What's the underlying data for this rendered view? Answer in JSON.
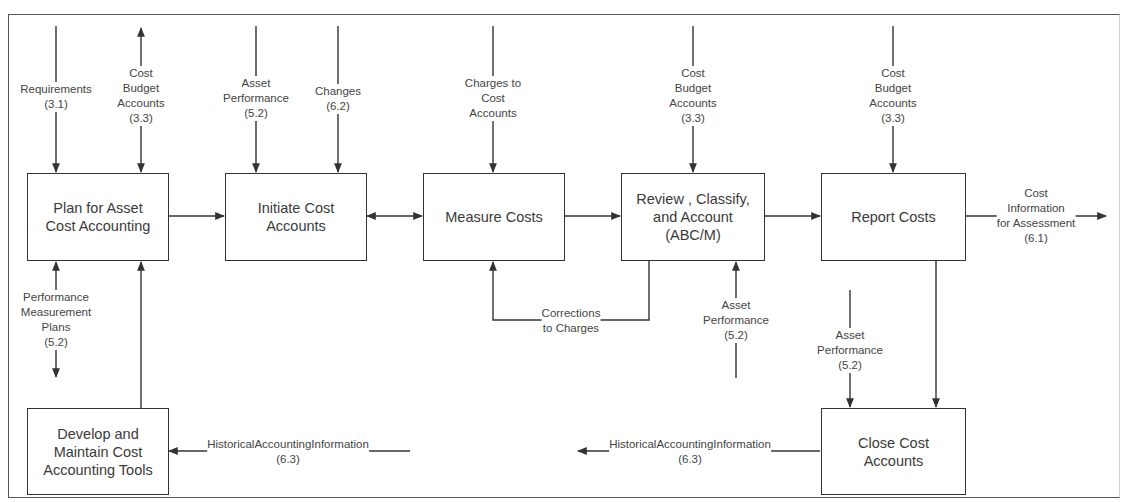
{
  "diagram": {
    "colors": {
      "line": "#333333",
      "text": "#3a3a3a",
      "frame": "#555555",
      "background": "#ffffff"
    },
    "boxes": {
      "plan": {
        "label": "Plan for Asset\nCost Accounting"
      },
      "initiate": {
        "label": "Initiate Cost\nAccounts"
      },
      "measure": {
        "label": "Measure Costs"
      },
      "review": {
        "label": "Review , Classify,\nand Account\n(ABC/M)"
      },
      "report": {
        "label": "Report Costs"
      },
      "develop": {
        "label": "Develop and\nMaintain Cost\nAccounting Tools"
      },
      "close": {
        "label": "Close Cost\nAccounts"
      }
    },
    "flows": {
      "requirements": {
        "label": "Requirements\n(3.1)"
      },
      "plan_budget": {
        "label": "Cost\nBudget\nAccounts\n(3.3)"
      },
      "initiate_asset_perf": {
        "label": "Asset\nPerformance\n(5.2)"
      },
      "initiate_changes": {
        "label": "Changes\n(6.2)"
      },
      "charges": {
        "label": "Charges to\nCost\nAccounts"
      },
      "review_budget": {
        "label": "Cost\nBudget\nAccounts\n(3.3)"
      },
      "report_budget": {
        "label": "Cost\nBudget\nAccounts\n(3.3)"
      },
      "cost_info": {
        "label": "Cost\nInformation\nfor Assessment\n(6.1)"
      },
      "perf_plans": {
        "label": "Performance\nMeasurement\nPlans\n(5.2)"
      },
      "corrections": {
        "label": "Corrections\nto Charges"
      },
      "review_asset_perf": {
        "label": "Asset\nPerformance\n(5.2)"
      },
      "close_asset_perf": {
        "label": "Asset\nPerformance\n(5.2)"
      },
      "hist_develop": {
        "label": "HistoricalAccountingInformation\n(6.3)"
      },
      "hist_close": {
        "label": "HistoricalAccountingInformation\n(6.3)"
      }
    }
  }
}
